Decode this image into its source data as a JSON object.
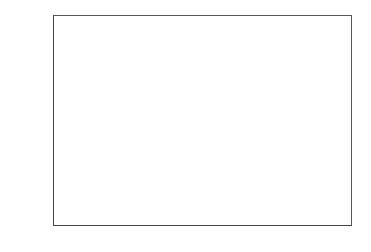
{
  "chart_data": {
    "type": "bar",
    "orientation": "horizontal",
    "title": "",
    "xlabel": "",
    "ylabel": "",
    "categories": [
      "China",
      "India",
      "Japan",
      "Mexico",
      "South Africa",
      "UK",
      "US"
    ],
    "category_labels": [
      [
        "China"
      ],
      [
        "India"
      ],
      [
        "Japan"
      ],
      [
        "Mexico"
      ],
      [
        "South",
        "Africa"
      ],
      [
        "UK"
      ],
      [
        "US"
      ]
    ],
    "series": [
      {
        "name": "1980",
        "color": "#b3b3b3",
        "values": [
          13,
          9.5,
          15,
          39,
          39,
          45,
          45
        ]
      },
      {
        "name": "2008",
        "color": "#6b6b6b",
        "values": [
          25.5,
          11,
          25,
          68,
          66,
          64,
          71
        ]
      }
    ],
    "xlim": [
      0,
      80
    ],
    "xticks": [
      "0",
      "10",
      "20",
      "30",
      "40",
      "50",
      "60",
      "70",
      "80"
    ],
    "grid": "vertical",
    "legend": {
      "position": "upper right",
      "entries": [
        "1980",
        "2008"
      ]
    }
  }
}
